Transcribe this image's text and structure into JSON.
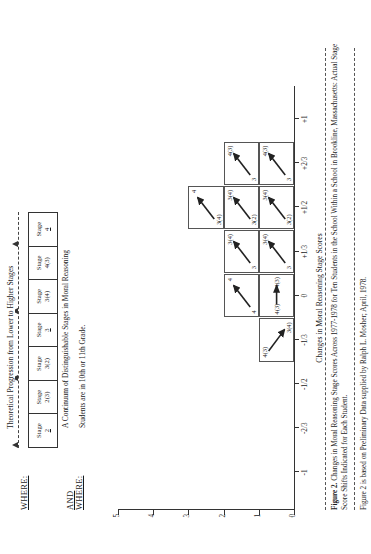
{
  "legend": {
    "where_label": "WHERE:",
    "and_where_label_line1": "AND",
    "and_where_label_line2": "WHERE:",
    "progression_text": "Theoretical Progression from Lower to Higher Stages",
    "continuum_text": "A Continuum of Distinguishable Stages in Moral Reasoning",
    "grade_text": "Students are in 10th or 11th Grade.",
    "stages": [
      {
        "name": "Stage",
        "value": "2",
        "underline": true
      },
      {
        "name": "Stage",
        "value": "2(3)",
        "underline": false
      },
      {
        "name": "Stage",
        "value": "3(2)",
        "underline": false
      },
      {
        "name": "Stage",
        "value": "3",
        "underline": true
      },
      {
        "name": "Stage",
        "value": "3(4)",
        "underline": false
      },
      {
        "name": "Stage",
        "value": "4(3)",
        "underline": false
      },
      {
        "name": "Stage",
        "value": "4",
        "underline": true
      }
    ]
  },
  "chart_data": {
    "type": "bar",
    "title": "",
    "xlabel": "Changes in Moral Reasoning Stage Scores",
    "ylabel": "",
    "ylim": [
      0,
      5
    ],
    "yticks": [
      "0",
      "1",
      "2",
      "3",
      "4",
      "5"
    ],
    "xticks": [
      "-1",
      "-2/3",
      "-1/2",
      "-1/3",
      "0",
      "+1/3",
      "+1/2",
      "+2/3",
      "+1"
    ],
    "xvalues": [
      -1,
      -0.6667,
      -0.5,
      -0.3333,
      0,
      0.3333,
      0.5,
      0.6667,
      1
    ],
    "grid": false,
    "legend_position": "none",
    "categories": [
      "-1/3",
      "0",
      "+1/3",
      "+1/2",
      "+2/3"
    ],
    "values": [
      1,
      2,
      2,
      3,
      2
    ],
    "cells": [
      {
        "x": "-1/3",
        "stack": 1,
        "from": "4(3)",
        "to": "3(4)",
        "dir": "down"
      },
      {
        "x": "0",
        "stack": 1,
        "from": "4(3)",
        "to": "4(3)",
        "dir": "right"
      },
      {
        "x": "0",
        "stack": 2,
        "from": "4",
        "to": "4",
        "dir": "up"
      },
      {
        "x": "+1/3",
        "stack": 1,
        "from": "3",
        "to": "3(4)",
        "dir": "up"
      },
      {
        "x": "+1/3",
        "stack": 2,
        "from": "3",
        "to": "3(4)",
        "dir": "up"
      },
      {
        "x": "+1/2",
        "stack": 1,
        "from": "3(2)",
        "to": "3(4)",
        "dir": "up"
      },
      {
        "x": "+1/2",
        "stack": 2,
        "from": "3(2)",
        "to": "3(4)",
        "dir": "up"
      },
      {
        "x": "+1/2",
        "stack": 3,
        "from": "3(4)",
        "to": "4",
        "dir": "up"
      },
      {
        "x": "+2/3",
        "stack": 1,
        "from": "3",
        "to": "4(3)",
        "dir": "up"
      },
      {
        "x": "+2/3",
        "stack": 2,
        "from": "3",
        "to": "4(3)",
        "dir": "up"
      }
    ]
  },
  "caption": {
    "number": "Figure 2.",
    "body": "Changes in Moral Reasoning Stage Scores Across 1977-1978 for Ten Students in the School Within a School in Brookline, Massachusetts:  Actual Stage Score Shifts Indicated for Each Student.",
    "source": "Figure 2 is based on Preliminary Data supplied by Ralph L. Mosher; April, 1978."
  }
}
